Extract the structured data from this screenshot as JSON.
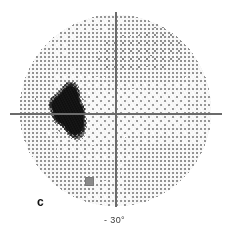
{
  "figure": {
    "panel_letter": "c",
    "type": "visual-field-grayscale-plot",
    "background_color": "#ffffff"
  },
  "axes": {
    "horizontal": {
      "name": "horizontal-meridian",
      "color": "#6b6b6b",
      "x_start": 10,
      "x_end": 222,
      "y": 113,
      "thickness": 2
    },
    "vertical": {
      "name": "vertical-meridian",
      "color": "#6b6b6b",
      "y_start": 12,
      "y_end": 207,
      "x": 115,
      "thickness": 2
    },
    "bottom_label": "- 30°"
  },
  "field": {
    "center_x": 115,
    "center_y": 110,
    "radius": 93,
    "fill_color": "#d8d8d8",
    "edge_color": "#b8b8b8"
  },
  "markers": [
    {
      "name": "fixation-loss-marker",
      "x": 85,
      "y": 177,
      "width": 7,
      "height": 7,
      "color": "#8a8a8a"
    }
  ],
  "chart_data": {
    "type": "heatmap",
    "title": "",
    "subtitle": "",
    "xlabel": "",
    "ylabel": "",
    "xlim": [
      -30,
      30
    ],
    "ylim": [
      -30,
      30
    ],
    "grid": false,
    "legend": null,
    "annotations": [
      {
        "text": "c",
        "x": 37,
        "y": 196
      },
      {
        "text": "- 30°",
        "x": 116,
        "y": 216
      }
    ],
    "scotomata": [
      {
        "name": "absolute-scotoma",
        "center_x": 68,
        "center_y": 110,
        "radius_x": 15,
        "radius_y": 27,
        "level": 0.97
      },
      {
        "name": "scotoma-halo",
        "center_x": 68,
        "center_y": 110,
        "radius_x": 22,
        "radius_y": 34,
        "level": 0.62
      }
    ],
    "depression_patches": [
      {
        "name": "superior-nasal-depression",
        "center_x": 150,
        "center_y": 55,
        "radius_x": 40,
        "radius_y": 32,
        "level": 0.2
      },
      {
        "name": "superior-central-depression",
        "center_x": 100,
        "center_y": 62,
        "radius_x": 34,
        "radius_y": 30,
        "level": 0.16
      },
      {
        "name": "inferior-nasal-depression",
        "center_x": 150,
        "center_y": 160,
        "radius_x": 45,
        "radius_y": 34,
        "level": 0.13
      },
      {
        "name": "inferior-temporal-depression",
        "center_x": 78,
        "center_y": 165,
        "radius_x": 34,
        "radius_y": 28,
        "level": 0.1
      },
      {
        "name": "temporal-rim-depression",
        "center_x": 40,
        "center_y": 100,
        "radius_x": 28,
        "radius_y": 46,
        "level": 0.12
      }
    ],
    "gray_levels": [
      0.06,
      0.12,
      0.2,
      0.32,
      0.48,
      0.68,
      0.85,
      0.97
    ]
  }
}
